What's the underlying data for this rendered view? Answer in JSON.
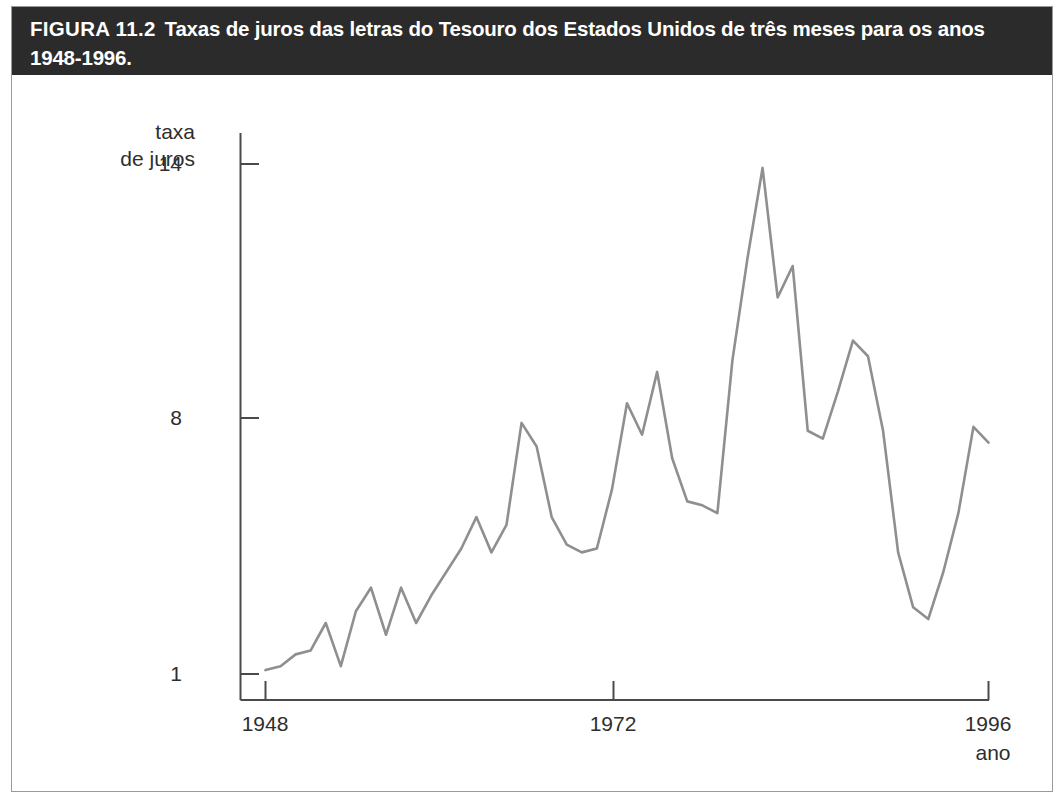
{
  "figure": {
    "label": "FIGURA 11.2",
    "caption": "Taxas de juros das letras do Tesouro dos Estados Unidos de três meses para os anos 1948-1996.",
    "background": "#ffffff",
    "caption_bar_color": "#2b2b2b",
    "caption_text_color": "#ffffff",
    "line_color": "#8f8f8f",
    "axis_color": "#4a4a4a"
  },
  "chart_data": {
    "type": "line",
    "title": "Taxas de juros das letras do Tesouro dos Estados Unidos de três meses para os anos 1948-1996.",
    "xlabel": "ano",
    "ylabel": "taxa de juros",
    "grid": false,
    "legend": "none",
    "xlim": [
      1948,
      1996
    ],
    "ylim": [
      1,
      14
    ],
    "xticks": [
      1948,
      1972,
      1996
    ],
    "xticklabels": [
      "1948",
      "1972",
      "1996"
    ],
    "yticks": [
      1,
      8,
      14
    ],
    "yticklabels": [
      "1",
      "8",
      "14"
    ],
    "series": [
      {
        "name": "taxa de juros",
        "color": "#8f8f8f",
        "x": [
          1948,
          1949,
          1950,
          1951,
          1952,
          1953,
          1954,
          1955,
          1956,
          1957,
          1958,
          1959,
          1960,
          1961,
          1962,
          1963,
          1964,
          1965,
          1966,
          1967,
          1968,
          1969,
          1970,
          1971,
          1972,
          1973,
          1974,
          1975,
          1976,
          1977,
          1978,
          1979,
          1980,
          1981,
          1982,
          1983,
          1984,
          1985,
          1986,
          1987,
          1988,
          1989,
          1990,
          1991,
          1992,
          1993,
          1994,
          1995,
          1996
        ],
        "values": [
          1.1,
          1.2,
          1.5,
          1.6,
          2.3,
          1.2,
          2.6,
          3.2,
          2.0,
          3.2,
          2.3,
          3.0,
          3.6,
          4.2,
          5.0,
          4.1,
          4.8,
          7.4,
          6.8,
          5.0,
          4.3,
          4.1,
          4.2,
          5.7,
          7.9,
          7.1,
          8.7,
          6.5,
          5.4,
          5.3,
          5.1,
          9.0,
          11.6,
          13.9,
          10.6,
          11.4,
          7.2,
          7.0,
          8.2,
          9.5,
          9.1,
          7.2,
          4.1,
          2.7,
          2.4,
          3.6,
          5.1,
          7.3,
          6.9
        ]
      }
    ]
  },
  "axes": {
    "y_title_line1": "taxa",
    "y_title_line2": "de juros",
    "x_title": "ano",
    "y_tick_top": "14",
    "y_tick_mid": "8",
    "y_tick_bottom": "1",
    "x_tick_first": "1948",
    "x_tick_mid": "1972",
    "x_tick_last": "1996"
  }
}
